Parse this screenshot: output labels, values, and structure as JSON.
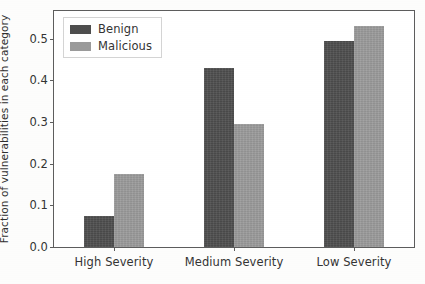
{
  "chart_data": {
    "type": "bar",
    "title": "",
    "xlabel": "",
    "ylabel": "Fraction of vulnerabilities in each category",
    "categories": [
      "High Severity",
      "Medium Severity",
      "Low Severity"
    ],
    "series": [
      {
        "name": "Benign",
        "color": "#4d4d4d",
        "values": [
          0.075,
          0.43,
          0.495
        ]
      },
      {
        "name": "Malicious",
        "color": "#9a9a9a",
        "values": [
          0.175,
          0.295,
          0.53
        ]
      }
    ],
    "ylim": [
      0.0,
      0.566
    ],
    "yticks": [
      0.0,
      0.1,
      0.2,
      0.3,
      0.4,
      0.5
    ],
    "ytick_labels": [
      "0.0",
      "0.1",
      "0.2",
      "0.3",
      "0.4",
      "0.5"
    ],
    "grid": false,
    "legend_position": "upper left"
  },
  "legend": {
    "entries": [
      {
        "label": "Benign"
      },
      {
        "label": "Malicious"
      }
    ]
  }
}
